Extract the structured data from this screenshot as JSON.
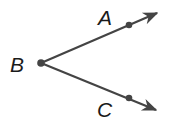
{
  "diagram": {
    "type": "angle",
    "name": "angle ABC",
    "vertex": {
      "label": "B",
      "x": 41,
      "y": 63
    },
    "points": [
      {
        "label": "A",
        "x": 129,
        "y": 25,
        "label_x": 98,
        "label_y": 25
      },
      {
        "label": "C",
        "x": 129,
        "y": 98,
        "label_x": 97,
        "label_y": 117
      }
    ],
    "rays": [
      {
        "name": "ray-BA",
        "from": "B",
        "through": "A",
        "tip_x": 159,
        "tip_y": 12
      },
      {
        "name": "ray-BC",
        "from": "B",
        "through": "C",
        "tip_x": 158,
        "tip_y": 111
      }
    ],
    "vertex_label": {
      "text": "B",
      "x": 10,
      "y": 72
    },
    "colors": {
      "stroke": "#444444",
      "text": "#1a1a1a"
    }
  }
}
